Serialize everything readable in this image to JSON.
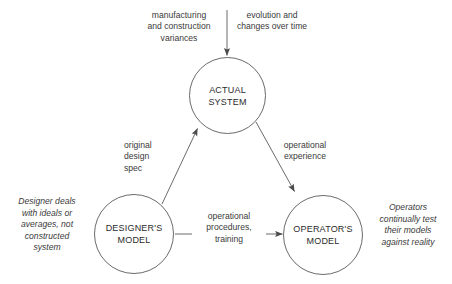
{
  "diagram": {
    "background_color": "#ffffff",
    "stroke_color": "#6b6b6b",
    "text_color": "#2b2b2b",
    "nodes": [
      {
        "id": "actual-system",
        "line1": "ACTUAL",
        "line2": "SYSTEM"
      },
      {
        "id": "designers-model",
        "line1": "DESIGNER'S",
        "line2": "MODEL"
      },
      {
        "id": "operators-model",
        "line1": "OPERATOR'S",
        "line2": "MODEL"
      }
    ],
    "labels": {
      "manufacturing": "manufacturing\nand construction\nvariances",
      "evolution": "evolution and\nchanges over time",
      "original_design_spec": "original\ndesign\nspec",
      "operational_experience": "operational\nexperience",
      "operational_procedures": "operational\nprocedures,\ntraining"
    },
    "annotations": {
      "designer_note": "Designer deals\nwith ideals or\naverages, not\nconstructed\nsystem",
      "operator_note": "Operators\ncontinually test\ntheir models\nagainst reality"
    }
  }
}
